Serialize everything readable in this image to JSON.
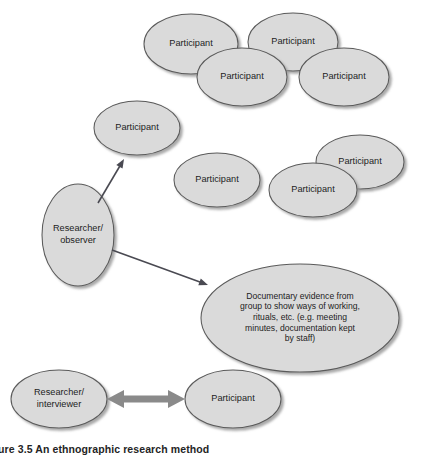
{
  "figure": {
    "caption": "Figure 3.5  An ethnographic research method",
    "width": 434,
    "height": 456,
    "background_color": "#ffffff",
    "node_fill_color": "#dadada",
    "node_stroke_color": "#5a5a5a",
    "text_color": "#1d1d1d",
    "thin_arrow_color": "#4a4a52",
    "thick_arrow_color": "#8a8a8a"
  },
  "nodes": [
    {
      "id": "participant-top-1",
      "label": "Participant",
      "group": "top-cluster",
      "cx": 191,
      "cy": 44,
      "rx": 47,
      "ry": 30,
      "lines": [
        "Participant"
      ]
    },
    {
      "id": "participant-top-2",
      "label": "Participant",
      "group": "top-cluster",
      "cx": 293,
      "cy": 42,
      "rx": 45,
      "ry": 29,
      "lines": [
        "Participant"
      ]
    },
    {
      "id": "participant-top-3",
      "label": "Participant",
      "group": "top-cluster",
      "cx": 242,
      "cy": 77,
      "rx": 45,
      "ry": 29,
      "lines": [
        "Participant"
      ]
    },
    {
      "id": "participant-top-4",
      "label": "Participant",
      "group": "top-cluster",
      "cx": 344,
      "cy": 77,
      "rx": 45,
      "ry": 29,
      "lines": [
        "Participant"
      ]
    },
    {
      "id": "participant-left",
      "label": "Participant",
      "group": "observed",
      "cx": 137,
      "cy": 128,
      "rx": 43,
      "ry": 27,
      "lines": [
        "Participant"
      ]
    },
    {
      "id": "participant-middle",
      "label": "Participant",
      "group": "observed",
      "cx": 217,
      "cy": 180,
      "rx": 43,
      "ry": 27,
      "lines": [
        "Participant"
      ]
    },
    {
      "id": "participant-right-upper",
      "label": "Participant",
      "group": "right-cluster",
      "cx": 360,
      "cy": 162,
      "rx": 44,
      "ry": 27,
      "lines": [
        "Participant"
      ]
    },
    {
      "id": "participant-right-lower",
      "label": "Participant",
      "group": "right-cluster",
      "cx": 313,
      "cy": 190,
      "rx": 44,
      "ry": 27,
      "lines": [
        "Participant"
      ]
    },
    {
      "id": "researcher-observer",
      "label": "Researcher/ observer",
      "group": "researcher",
      "cx": 78,
      "cy": 235,
      "rx": 36,
      "ry": 51,
      "lines": [
        "Researcher/",
        "observer"
      ]
    },
    {
      "id": "documentary-evidence",
      "label": "Documentary evidence from group to show ways of working, rituals, etc. (e.g. meeting minutes, documentation kept by staff)",
      "group": "evidence",
      "cx": 300,
      "cy": 318,
      "rx": 99,
      "ry": 54,
      "lines": [
        "Documentary evidence from",
        "group to show ways of working,",
        "rituals, etc. (e.g. meeting",
        "minutes, documentation kept",
        "by staff)"
      ]
    },
    {
      "id": "researcher-interviewer",
      "label": "Researcher/ interviewer",
      "group": "researcher",
      "cx": 59,
      "cy": 399,
      "rx": 48,
      "ry": 29,
      "lines": [
        "Researcher/",
        "interviewer"
      ]
    },
    {
      "id": "participant-interviewee",
      "label": "Participant",
      "group": "interview",
      "cx": 233,
      "cy": 399,
      "rx": 48,
      "ry": 29,
      "lines": [
        "Participant"
      ]
    }
  ],
  "connections": [
    {
      "id": "observer-to-participant-left",
      "from": "researcher-observer",
      "to": "participant-left",
      "style": "thin-arrow",
      "direction": "one-way",
      "x1": 98,
      "y1": 203,
      "x2": 124,
      "y2": 159
    },
    {
      "id": "observer-to-documentary-evidence",
      "from": "researcher-observer",
      "to": "documentary-evidence",
      "style": "thin-arrow",
      "direction": "one-way",
      "x1": 112,
      "y1": 250,
      "x2": 208,
      "y2": 285
    },
    {
      "id": "interviewer-to-participant",
      "from": "researcher-interviewer",
      "to": "participant-interviewee",
      "style": "thick-arrow",
      "direction": "two-way",
      "x1": 107,
      "y1": 399,
      "x2": 185,
      "y2": 399
    }
  ]
}
